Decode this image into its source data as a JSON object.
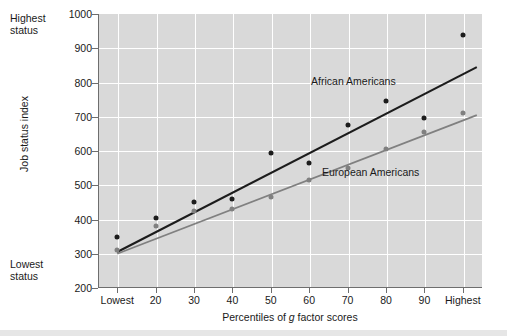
{
  "chart_data": {
    "type": "scatter",
    "title": "",
    "xlabel": "Percentiles of g factor scores",
    "xlabel_parts": {
      "pre": "Percentiles of ",
      "italic": "g",
      "post": " factor scores"
    },
    "ylabel": "Job status index",
    "categories": [
      "Lowest",
      "20",
      "30",
      "40",
      "50",
      "60",
      "70",
      "80",
      "90",
      "Highest"
    ],
    "ylim": [
      200,
      1000
    ],
    "yticks": [
      200,
      300,
      400,
      500,
      600,
      700,
      800,
      900,
      1000
    ],
    "grid": true,
    "grid_color": "#ffffff",
    "plot_background": "#d9d9d9",
    "legend_position": "inline-annotation",
    "annotations": {
      "y_high": "Highest\nstatus",
      "y_low": "Lowest\nstatus"
    },
    "series": [
      {
        "name": "African Americans",
        "color": "#1c1c1c",
        "marker": "circle",
        "values": [
          350,
          405,
          450,
          460,
          595,
          565,
          675,
          745,
          695,
          940
        ],
        "trend_line": {
          "start": 305,
          "end": 845
        },
        "label_x_category_index": 6.15,
        "label_y_value": 805
      },
      {
        "name": "European Americans",
        "color": "#808080",
        "marker": "circle",
        "values": [
          310,
          380,
          425,
          430,
          465,
          515,
          550,
          605,
          655,
          710
        ],
        "trend_line": {
          "start": 300,
          "end": 705
        },
        "label_x_category_index": 6.6,
        "label_y_value": 540
      }
    ]
  }
}
